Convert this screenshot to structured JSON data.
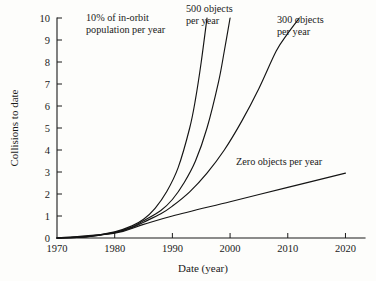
{
  "chart_data": {
    "type": "line",
    "title": "",
    "xlabel": "Date (year)",
    "ylabel": "Collisions to date",
    "xlim": [
      1970,
      2022
    ],
    "ylim": [
      0,
      10
    ],
    "grid": false,
    "legend_position": "inline-annotations",
    "x_ticks": [
      1970,
      1980,
      1990,
      2000,
      2010,
      2020
    ],
    "x_tick_labels": [
      "1970",
      "1980",
      "1990",
      "2000",
      "2010",
      "2020"
    ],
    "y_ticks": [
      0,
      1,
      2,
      3,
      4,
      5,
      6,
      7,
      8,
      9,
      10
    ],
    "y_tick_labels": [
      "0",
      "1",
      "2",
      "3",
      "4",
      "5",
      "6",
      "7",
      "8",
      "9",
      "10"
    ],
    "series": [
      {
        "name": "10% of in-orbit population per year",
        "label": "10% of in-orbit\npopulation per year",
        "x": [
          1970,
          1975,
          1980,
          1983,
          1985,
          1987,
          1989,
          1991,
          1993,
          1994,
          1995,
          1996
        ],
        "values": [
          0,
          0.06,
          0.28,
          0.55,
          0.85,
          1.35,
          2.1,
          3.2,
          5.0,
          6.3,
          8.0,
          10.0
        ]
      },
      {
        "name": "500 objects per year",
        "label": "500 objects\nper year",
        "x": [
          1970,
          1975,
          1980,
          1983,
          1985,
          1988,
          1990,
          1992,
          1994,
          1996,
          1998,
          1999,
          2000
        ],
        "values": [
          0,
          0.05,
          0.26,
          0.5,
          0.78,
          1.25,
          1.75,
          2.5,
          3.5,
          5.0,
          7.1,
          8.5,
          10.0
        ]
      },
      {
        "name": "300 objects per year",
        "label": "300 objects\nper year",
        "x": [
          1970,
          1975,
          1980,
          1983,
          1985,
          1988,
          1990,
          1993,
          1996,
          1999,
          2002,
          2005,
          2008,
          2010,
          2012
        ],
        "values": [
          0,
          0.05,
          0.24,
          0.47,
          0.72,
          1.1,
          1.45,
          2.1,
          2.95,
          4.0,
          5.3,
          6.8,
          8.5,
          9.3,
          10.0
        ]
      },
      {
        "name": "Zero objects per year",
        "label": "Zero objects per year",
        "x": [
          1970,
          1980,
          1985,
          1990,
          2000,
          2010,
          2020
        ],
        "values": [
          0,
          0.22,
          0.62,
          1.0,
          1.65,
          2.3,
          2.95
        ]
      }
    ]
  },
  "annotations": {
    "curve_10pct": "10% of in-orbit\npopulation per year",
    "curve_500": "500 objects\nper year",
    "curve_300": "300 objects\nper year",
    "curve_zero": "Zero objects per year"
  },
  "axes": {
    "x_title": "Date (year)",
    "y_title": "Collisions to date"
  },
  "colors": {
    "background": "#fdfdfb",
    "line": "#141414",
    "text": "#1a1a1a"
  }
}
